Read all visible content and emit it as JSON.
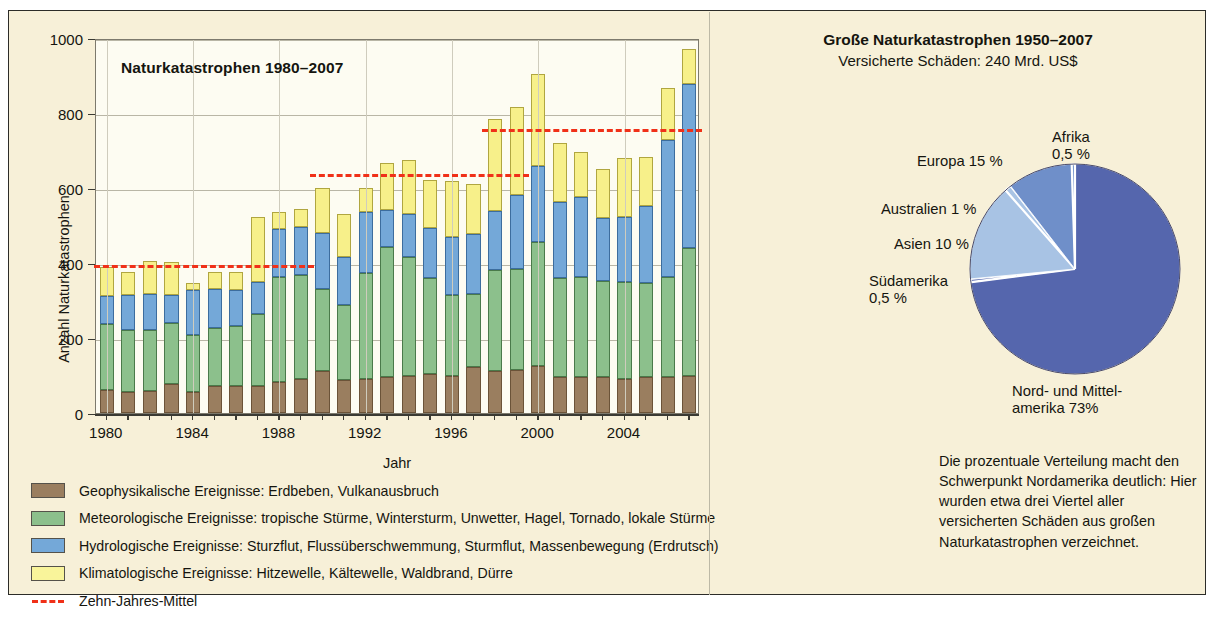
{
  "chart_data": [
    {
      "type": "bar",
      "title": "Naturkatastrophen 1980–2007",
      "xlabel": "Jahr",
      "ylabel": "Anzahl Naturkatastrophen",
      "ylim": [
        0,
        1000
      ],
      "yticks": [
        0,
        200,
        400,
        600,
        800,
        1000
      ],
      "xticks": [
        1980,
        1984,
        1988,
        1992,
        1996,
        2000,
        2004
      ],
      "grid": true,
      "stacked": true,
      "categories": [
        1980,
        1981,
        1982,
        1983,
        1984,
        1985,
        1986,
        1987,
        1988,
        1989,
        1990,
        1991,
        1992,
        1993,
        1994,
        1995,
        1996,
        1997,
        1998,
        1999,
        2000,
        2001,
        2002,
        2003,
        2004,
        2005,
        2006,
        2007
      ],
      "series": [
        {
          "name": "Geophysikalische Ereignisse",
          "color": "#9a7e5f",
          "values": [
            62,
            55,
            60,
            77,
            57,
            72,
            73,
            72,
            82,
            90,
            112,
            88,
            90,
            97,
            99,
            103,
            99,
            122,
            113,
            116,
            126,
            95,
            95,
            95,
            90,
            95,
            95,
            99
          ]
        },
        {
          "name": "Meteorologische Ereignisse",
          "color": "#8cc08c",
          "values": [
            176,
            167,
            162,
            163,
            152,
            154,
            159,
            191,
            280,
            279,
            219,
            201,
            284,
            345,
            318,
            258,
            216,
            195,
            268,
            267,
            330,
            265,
            267,
            258,
            260,
            253,
            267,
            341
          ]
        },
        {
          "name": "Hydrologische Ereignisse",
          "color": "#74a8d8",
          "values": [
            75,
            92,
            96,
            75,
            120,
            104,
            97,
            86,
            129,
            127,
            150,
            126,
            163,
            99,
            114,
            132,
            155,
            160,
            158,
            199,
            202,
            202,
            213,
            168,
            174,
            204,
            365,
            437
          ]
        },
        {
          "name": "Klimatologische Ereignisse",
          "color": "#f7f08a",
          "values": [
            77,
            62,
            87,
            88,
            17,
            47,
            48,
            173,
            46,
            48,
            119,
            115,
            63,
            125,
            144,
            128,
            150,
            135,
            244,
            235,
            245,
            158,
            121,
            130,
            156,
            130,
            139,
            95
          ]
        }
      ],
      "totals": [
        390,
        376,
        405,
        403,
        346,
        377,
        377,
        522,
        527,
        526,
        600,
        530,
        600,
        666,
        675,
        621,
        620,
        612,
        783,
        817,
        903,
        720,
        696,
        651,
        680,
        682,
        866,
        972
      ],
      "annotations": [
        {
          "label": "Zehn-Jahres-Mittel",
          "value": 400,
          "from": 1980,
          "to": 1989
        },
        {
          "label": "Zehn-Jahres-Mittel",
          "value": 644,
          "from": 1990,
          "to": 1999
        },
        {
          "label": "Zehn-Jahres-Mittel",
          "value": 764,
          "from": 1998,
          "to": 2007
        }
      ]
    },
    {
      "type": "pie",
      "title": "Große Naturkatastrophen 1950–2007",
      "subtitle": "Versicherte Schäden: 240 Mrd. US$",
      "labels": [
        "Nord- und Mittelamerika",
        "Afrika",
        "Europa",
        "Australien",
        "Asien",
        "Südamerika"
      ],
      "values": [
        73,
        0.5,
        15,
        1,
        10,
        0.5
      ],
      "value_labels": [
        "73%",
        "0,5 %",
        "15 %",
        "1 %",
        "10 %",
        "0,5 %"
      ],
      "colors": [
        "#5566ad",
        "#5566ad",
        "#a8c3e4",
        "#a8c3e4",
        "#6f8fc9",
        "#6f8fc9"
      ]
    }
  ],
  "chart": {
    "title": "Naturkatastrophen 1980–2007",
    "ylabel": "Anzahl Naturkatastrophen",
    "xlabel": "Jahr",
    "ytick_labels": [
      "1000",
      "800",
      "600",
      "400",
      "200",
      "0"
    ],
    "xtick_labels": [
      "1980",
      "1984",
      "1988",
      "1992",
      "1996",
      "2000",
      "2004"
    ]
  },
  "legend": {
    "items": [
      {
        "swatch": "geo",
        "text": "Geophysikalische Ereignisse: Erdbeben, Vulkanausbruch"
      },
      {
        "swatch": "met",
        "text": "Meteorologische Ereignisse: tropische Stürme, Wintersturm, Unwetter, Hagel, Tornado, lokale Stürme"
      },
      {
        "swatch": "hyd",
        "text": "Hydrologische Ereignisse: Sturzflut, Flussüberschwemmung, Sturmflut, Massenbewegung (Erdrutsch)"
      },
      {
        "swatch": "kli",
        "text": "Klimatologische Ereignisse: Hitzewelle, Kältewelle, Waldbrand, Dürre"
      },
      {
        "swatch": "dash",
        "text": "Zehn-Jahres-Mittel"
      }
    ]
  },
  "right": {
    "title": "Große Naturkatastrophen 1950–2007",
    "subtitle": "Versicherte Schäden: 240 Mrd. US$",
    "pie_labels": {
      "afrika": "Afrika\n0,5 %",
      "afrika_l1": "Afrika",
      "afrika_l2": "0,5 %",
      "europa": "Europa 15 %",
      "australien": "Australien 1 %",
      "asien": "Asien 10 %",
      "suedamerika_l1": "Südamerika",
      "suedamerika_l2": "0,5 %",
      "nordamerika_l1": "Nord- und Mittel-",
      "nordamerika_l2": "amerika 73%"
    },
    "note": "Die prozentuale Verteilung macht den Schwerpunkt Nordamerika deutlich: Hier wurden etwa drei Viertel aller versicherten Schäden aus großen Naturkatastrophen verzeichnet."
  },
  "colors": {
    "geophysical": "#9a7e5f",
    "meteorological": "#8cc08c",
    "hydrological": "#74a8d8",
    "climatological": "#f7f08a",
    "mean_line": "#f03018",
    "panel_bg": "#f7f0d8",
    "plot_bg": "#fdfcf2"
  }
}
